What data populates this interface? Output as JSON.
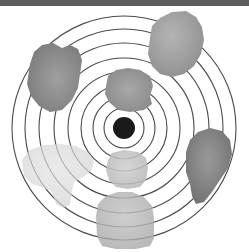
{
  "canvas": {
    "width": 249,
    "height": 252,
    "background": "#ffffff"
  },
  "top_bar": {
    "color": "#5e5e5e",
    "height": 6,
    "label": ""
  },
  "chart_data": {
    "type": "scatter",
    "subtitle": "",
    "xlabel": "",
    "ylabel": "",
    "grid": true,
    "legend_position": "none",
    "annotations": [],
    "center": {
      "label": "center-dot",
      "x": 124,
      "y": 128,
      "radius": 11,
      "color": "#1a1a1a"
    },
    "rings": {
      "label": "concentric-rings",
      "count": 8,
      "stroke": "#4a4a4a",
      "stroke_width": 1.1,
      "fill": "none",
      "radii": [
        20,
        31,
        43,
        56,
        70,
        85,
        99,
        112
      ]
    },
    "blobs": [
      {
        "name": "blob-top-right",
        "cx": 176,
        "cy": 50,
        "fill_light": "#b4b4b4",
        "fill_dark": "#8d8d8d",
        "opacity": 1.0,
        "path": "M150,38 L152,26 L160,18 L172,12 L186,11 L196,17 L202,27 L204,40 L201,54 L194,66 L184,74 L172,77 L160,74 L152,66 L148,54 Z"
      },
      {
        "name": "blob-top-left",
        "cx": 54,
        "cy": 78,
        "fill_light": "#a0a0a0",
        "fill_dark": "#767676",
        "opacity": 1.0,
        "path": "M30,64 L34,52 L42,45 L53,43 L62,48 L70,45 L78,49 L82,60 L80,74 L78,88 L72,100 L62,110 L50,112 L39,106 L31,96 L27,84 Z"
      },
      {
        "name": "blob-upper-center",
        "cx": 127,
        "cy": 92,
        "fill_light": "#a8a8a8",
        "fill_dark": "#848484",
        "opacity": 1.0,
        "path": "M106,86 L108,76 L116,70 L128,68 L140,70 L150,76 L153,86 L150,96 L152,104 L144,110 L130,112 L118,110 L109,102 L105,94 Z"
      },
      {
        "name": "blob-right",
        "cx": 206,
        "cy": 168,
        "fill_light": "#9a9a9a",
        "fill_dark": "#6c6c6c",
        "opacity": 1.0,
        "path": "M186,152 L190,140 L198,132 L210,128 L222,131 L230,140 L232,154 L228,168 L220,180 L212,192 L204,202 L196,204 L192,196 L190,184 L186,172 Z"
      },
      {
        "name": "blob-bottom-center",
        "cx": 124,
        "cy": 218,
        "fill_light": "#c4c4c4",
        "fill_dark": "#a6a6a6",
        "opacity": 0.82,
        "path": "M96,216 L98,204 L106,196 L118,192 L132,192 L144,197 L152,206 L154,218 L154,238 L150,246 L136,249 L116,249 L102,246 L97,236 Z"
      },
      {
        "name": "blob-center-low",
        "cx": 126,
        "cy": 170,
        "fill_light": "#cfcfcf",
        "fill_dark": "#b2b2b2",
        "opacity": 0.86,
        "path": "M108,160 L112,153 L124,150 L138,152 L146,158 L148,168 L146,180 L140,187 L128,189 L116,187 L109,180 L106,170 Z"
      },
      {
        "name": "blob-left-light",
        "cx": 58,
        "cy": 172,
        "fill_light": "#e2e2e2",
        "fill_dark": "#cfcfcf",
        "opacity": 0.7,
        "path": "M22,160 L30,150 L44,145 L60,144 L76,146 L88,152 L94,160 L92,170 L82,178 L74,182 L72,192 L70,204 L64,208 L56,204 L52,192 L44,188 L32,184 L24,176 Z"
      }
    ]
  }
}
